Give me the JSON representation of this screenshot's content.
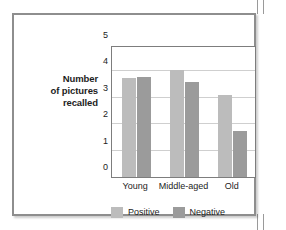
{
  "chart_data": {
    "type": "bar",
    "title": "",
    "subtitle": "",
    "xlabel": "",
    "ylabel": "Number of pictures recalled",
    "ylabel_lines": [
      "Number",
      "of pictures",
      "recalled"
    ],
    "categories": [
      "Young",
      "Middle-aged",
      "Old"
    ],
    "series": [
      {
        "name": "Positive",
        "color": "#bcbcbc",
        "values": [
          3.75,
          4.05,
          3.1
        ]
      },
      {
        "name": "Negative",
        "color": "#9b9b9b",
        "values": [
          3.78,
          3.6,
          1.75
        ]
      }
    ],
    "ylim": [
      0,
      5
    ],
    "yticks": [
      5,
      4,
      3,
      2,
      1,
      0
    ],
    "ytick_labels": [
      "5",
      "4",
      "3",
      "2",
      "1",
      "0"
    ],
    "grid": true,
    "grid_color": "#cfcfcf",
    "legend_position": "bottom-center",
    "plot_border_color": "#7d7d7d",
    "frame_color": "#8e8e8e",
    "background": "#ffffff"
  }
}
